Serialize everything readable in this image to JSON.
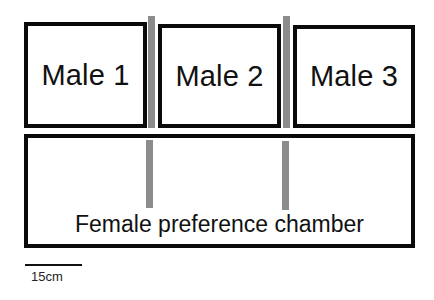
{
  "diagram": {
    "title": "",
    "male_chambers": [
      {
        "label": "Male 1"
      },
      {
        "label": "Male 2"
      },
      {
        "label": "Male 3"
      }
    ],
    "female_chamber": {
      "label": "Female preference chamber"
    },
    "scale_bar": {
      "label": "15cm"
    },
    "colors": {
      "border": "#0a0a0a",
      "divider": "#8c8c8c",
      "background": "#ffffff"
    }
  }
}
